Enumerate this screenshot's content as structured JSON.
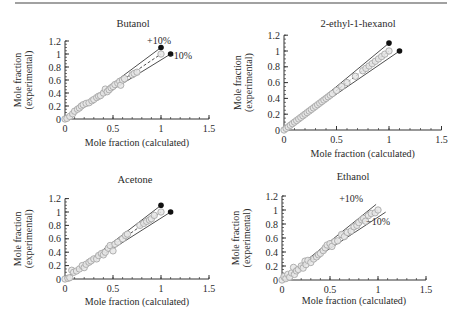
{
  "figure": {
    "top_rule": {
      "x1": 15,
      "x2": 447,
      "y": 3
    }
  },
  "chart_data": [
    {
      "type": "scatter",
      "title": "Butanol",
      "xlabel": "Mole fraction (calculated)",
      "ylabel": [
        "Mole fraction",
        "(experimental)"
      ],
      "xlim": [
        0,
        1.5
      ],
      "ylim": [
        0,
        1.2
      ],
      "xticks": [
        0,
        0.5,
        1,
        1.5
      ],
      "xtick_labels": [
        "0",
        "0.5",
        "1",
        "1.5"
      ],
      "yticks": [
        0,
        0.2,
        0.4,
        0.6,
        0.8,
        1,
        1.2
      ],
      "ytick_labels": [
        "0",
        "0.2",
        "0.4",
        "0.6",
        "0.8",
        "1",
        "1.2"
      ],
      "grid": false,
      "reference_lines": [
        {
          "name": "+10%",
          "from": [
            0,
            0
          ],
          "to": [
            1.0,
            1.1
          ],
          "endpoint_marker": true
        },
        {
          "name": "1:1",
          "from": [
            0,
            0
          ],
          "to": [
            1.0,
            1.0
          ],
          "endpoint_marker": false
        },
        {
          "name": "-10%",
          "from": [
            0,
            0
          ],
          "to": [
            1.1,
            1.0
          ],
          "endpoint_marker": true
        }
      ],
      "annotations": [
        {
          "text": "+10%",
          "x": 0.98,
          "y": 1.16
        },
        {
          "text": "−10%",
          "x": 1.2,
          "y": 0.93
        }
      ],
      "points": [
        [
          0,
          0
        ],
        [
          0.02,
          0.01
        ],
        [
          0.05,
          0.04
        ],
        [
          0.08,
          0.08
        ],
        [
          0.1,
          0.12
        ],
        [
          0.13,
          0.15
        ],
        [
          0.15,
          0.17
        ],
        [
          0.17,
          0.2
        ],
        [
          0.19,
          0.22
        ],
        [
          0.22,
          0.24
        ],
        [
          0.25,
          0.25
        ],
        [
          0.28,
          0.28
        ],
        [
          0.3,
          0.3
        ],
        [
          0.33,
          0.33
        ],
        [
          0.35,
          0.35
        ],
        [
          0.37,
          0.36
        ],
        [
          0.4,
          0.4
        ],
        [
          0.42,
          0.46
        ],
        [
          0.44,
          0.42
        ],
        [
          0.46,
          0.45
        ],
        [
          0.48,
          0.48
        ],
        [
          0.5,
          0.5
        ],
        [
          0.52,
          0.53
        ],
        [
          0.55,
          0.55
        ],
        [
          0.57,
          0.58
        ],
        [
          0.58,
          0.52
        ],
        [
          0.6,
          0.6
        ],
        [
          0.62,
          0.62
        ],
        [
          0.7,
          0.68
        ],
        [
          0.72,
          0.7
        ],
        [
          0.75,
          0.72
        ],
        [
          1.0,
          1.0
        ]
      ],
      "layout": {
        "x0": 65,
        "y0": 119,
        "px_per_x": 96,
        "px_per_y": 65,
        "title_x": 133,
        "title_y": 27,
        "xlabel_y": 146,
        "ylabel_x": 21
      }
    },
    {
      "type": "scatter",
      "title": "2-ethyl-1-hexanol",
      "xlabel": "Mole fraction (calculated)",
      "ylabel": [
        "Mole fraction",
        "(experimental)"
      ],
      "xlim": [
        0,
        1.5
      ],
      "ylim": [
        0,
        1.2
      ],
      "xticks": [
        0,
        0.5,
        1,
        1.5
      ],
      "xtick_labels": [
        "0",
        "0.5",
        "1",
        "1.5"
      ],
      "yticks": [
        0,
        0.2,
        0.4,
        0.6,
        0.8,
        1,
        1.2
      ],
      "ytick_labels": [
        "0",
        "0.2",
        "0.4",
        "0.6",
        "0.8",
        "1",
        "1.2"
      ],
      "grid": false,
      "reference_lines": [
        {
          "name": "+10%",
          "from": [
            0,
            0
          ],
          "to": [
            1.0,
            1.1
          ],
          "endpoint_marker": true
        },
        {
          "name": "1:1",
          "from": [
            0,
            0
          ],
          "to": [
            1.0,
            1.0
          ],
          "endpoint_marker": false
        },
        {
          "name": "-10%",
          "from": [
            0,
            0
          ],
          "to": [
            1.1,
            1.0
          ],
          "endpoint_marker": true
        }
      ],
      "annotations": [],
      "points": [
        [
          0,
          0
        ],
        [
          0.02,
          0.02
        ],
        [
          0.04,
          0.04
        ],
        [
          0.06,
          0.06
        ],
        [
          0.08,
          0.08
        ],
        [
          0.1,
          0.1
        ],
        [
          0.12,
          0.12
        ],
        [
          0.14,
          0.14
        ],
        [
          0.16,
          0.16
        ],
        [
          0.18,
          0.18
        ],
        [
          0.2,
          0.2
        ],
        [
          0.22,
          0.22
        ],
        [
          0.24,
          0.24
        ],
        [
          0.26,
          0.26
        ],
        [
          0.28,
          0.28
        ],
        [
          0.3,
          0.3
        ],
        [
          0.32,
          0.32
        ],
        [
          0.34,
          0.34
        ],
        [
          0.36,
          0.36
        ],
        [
          0.38,
          0.38
        ],
        [
          0.4,
          0.4
        ],
        [
          0.42,
          0.42
        ],
        [
          0.44,
          0.44
        ],
        [
          0.46,
          0.46
        ],
        [
          0.5,
          0.5
        ],
        [
          0.55,
          0.55
        ],
        [
          0.6,
          0.6
        ],
        [
          0.68,
          0.68
        ],
        [
          0.75,
          0.75
        ],
        [
          0.78,
          0.78
        ],
        [
          0.81,
          0.81
        ],
        [
          0.84,
          0.84
        ],
        [
          0.87,
          0.87
        ],
        [
          0.9,
          0.9
        ],
        [
          0.93,
          0.93
        ],
        [
          0.96,
          0.96
        ],
        [
          1.0,
          1.0
        ]
      ],
      "layout": {
        "x0": 284,
        "y0": 130,
        "px_per_x": 105,
        "px_per_y": 79,
        "title_x": 358,
        "title_y": 27,
        "xlabel_y": 157,
        "ylabel_x": 241
      }
    },
    {
      "type": "scatter",
      "title": "Acetone",
      "xlabel": "Mole fraction (calculated)",
      "ylabel": [
        "Mole fraction",
        "(experimental)"
      ],
      "xlim": [
        0,
        1.5
      ],
      "ylim": [
        0,
        1.2
      ],
      "xticks": [
        0,
        0.5,
        1,
        1.5
      ],
      "xtick_labels": [
        "0",
        "0.5",
        "1",
        "1.5"
      ],
      "yticks": [
        0,
        0.2,
        0.4,
        0.6,
        0.8,
        1,
        1.2
      ],
      "ytick_labels": [
        "0",
        "0.2",
        "0.4",
        "0.6",
        "0.8",
        "1",
        "1.2"
      ],
      "grid": false,
      "reference_lines": [
        {
          "name": "+10%",
          "from": [
            0,
            0
          ],
          "to": [
            1.0,
            1.1
          ],
          "endpoint_marker": true
        },
        {
          "name": "1:1",
          "from": [
            0,
            0
          ],
          "to": [
            1.0,
            1.0
          ],
          "endpoint_marker": false
        },
        {
          "name": "-10%",
          "from": [
            0,
            0
          ],
          "to": [
            1.1,
            1.0
          ],
          "endpoint_marker": true
        }
      ],
      "annotations": [],
      "points": [
        [
          0,
          0
        ],
        [
          0.03,
          0.01
        ],
        [
          0.05,
          0.02
        ],
        [
          0.07,
          0.13
        ],
        [
          0.09,
          0.1
        ],
        [
          0.12,
          0.12
        ],
        [
          0.15,
          0.15
        ],
        [
          0.18,
          0.2
        ],
        [
          0.2,
          0.17
        ],
        [
          0.22,
          0.22
        ],
        [
          0.25,
          0.25
        ],
        [
          0.27,
          0.27
        ],
        [
          0.3,
          0.3
        ],
        [
          0.33,
          0.3
        ],
        [
          0.35,
          0.35
        ],
        [
          0.38,
          0.38
        ],
        [
          0.4,
          0.36
        ],
        [
          0.42,
          0.4
        ],
        [
          0.45,
          0.46
        ],
        [
          0.47,
          0.5
        ],
        [
          0.5,
          0.42
        ],
        [
          0.52,
          0.52
        ],
        [
          0.55,
          0.55
        ],
        [
          0.6,
          0.6
        ],
        [
          0.63,
          0.65
        ],
        [
          0.65,
          0.67
        ],
        [
          0.78,
          0.8
        ],
        [
          0.82,
          0.83
        ],
        [
          0.85,
          0.86
        ],
        [
          0.88,
          0.88
        ],
        [
          0.9,
          0.9
        ],
        [
          0.93,
          0.95
        ],
        [
          1.0,
          1.0
        ]
      ],
      "layout": {
        "x0": 65,
        "y0": 279,
        "px_per_x": 96,
        "px_per_y": 67,
        "title_x": 135,
        "title_y": 183,
        "xlabel_y": 305,
        "ylabel_x": 21
      }
    },
    {
      "type": "scatter",
      "title": "Ethanol",
      "xlabel": "Mole fraction (calculated)",
      "ylabel": [
        "Mole fraction",
        "(experimental)"
      ],
      "xlim": [
        0,
        1.5
      ],
      "ylim": [
        0,
        1.2
      ],
      "xticks": [
        0,
        0.5,
        1,
        1.5
      ],
      "xtick_labels": [
        "0",
        "0.5",
        "1",
        "1.5"
      ],
      "yticks": [
        0,
        0.2,
        0.4,
        0.6,
        0.8,
        1,
        1.2
      ],
      "ytick_labels": [
        "0",
        "0.2",
        "0.4",
        "0.6",
        "0.8",
        "1",
        "1.2"
      ],
      "grid": false,
      "reference_lines": [
        {
          "name": "+10%",
          "from": [
            0,
            0
          ],
          "to": [
            0.98,
            1.08
          ],
          "endpoint_marker": false
        },
        {
          "name": "1:1",
          "from": [
            0,
            0
          ],
          "to": [
            1.0,
            1.0
          ],
          "endpoint_marker": false
        },
        {
          "name": "-10%",
          "from": [
            0,
            0
          ],
          "to": [
            1.08,
            0.97
          ],
          "endpoint_marker": false
        }
      ],
      "annotations": [
        {
          "text": "+10%",
          "x": 0.72,
          "y": 1.12
        },
        {
          "text": "−10%",
          "x": 1.0,
          "y": 0.78
        }
      ],
      "points": [
        [
          0,
          0
        ],
        [
          0.02,
          0.05
        ],
        [
          0.04,
          0.02
        ],
        [
          0.06,
          0.08
        ],
        [
          0.08,
          0.04
        ],
        [
          0.1,
          0.1
        ],
        [
          0.12,
          0.18
        ],
        [
          0.13,
          0.08
        ],
        [
          0.15,
          0.13
        ],
        [
          0.17,
          0.15
        ],
        [
          0.2,
          0.2
        ],
        [
          0.22,
          0.17
        ],
        [
          0.24,
          0.27
        ],
        [
          0.25,
          0.22
        ],
        [
          0.27,
          0.28
        ],
        [
          0.3,
          0.25
        ],
        [
          0.33,
          0.3
        ],
        [
          0.36,
          0.33
        ],
        [
          0.38,
          0.36
        ],
        [
          0.4,
          0.38
        ],
        [
          0.43,
          0.42
        ],
        [
          0.45,
          0.46
        ],
        [
          0.47,
          0.5
        ],
        [
          0.5,
          0.52
        ],
        [
          0.52,
          0.48
        ],
        [
          0.55,
          0.55
        ],
        [
          0.58,
          0.56
        ],
        [
          0.62,
          0.65
        ],
        [
          0.65,
          0.62
        ],
        [
          0.68,
          0.68
        ],
        [
          0.72,
          0.7
        ],
        [
          0.75,
          0.76
        ],
        [
          0.78,
          0.78
        ],
        [
          0.8,
          0.82
        ],
        [
          0.83,
          0.86
        ],
        [
          0.85,
          0.88
        ],
        [
          0.87,
          0.84
        ],
        [
          0.9,
          0.92
        ],
        [
          0.93,
          0.95
        ],
        [
          0.97,
          0.96
        ],
        [
          1.0,
          1.0
        ]
      ],
      "layout": {
        "x0": 282,
        "y0": 280,
        "px_per_x": 96,
        "px_per_y": 70,
        "title_x": 353,
        "title_y": 180,
        "xlabel_y": 304,
        "ylabel_x": 239
      }
    }
  ],
  "colors": {
    "axis": "#333333",
    "line": "#3a3a3a",
    "marker_fill": "#e6e6e6",
    "marker_edge": "#a8a8a8",
    "endpoint": "#111111",
    "rule": "#444444"
  }
}
